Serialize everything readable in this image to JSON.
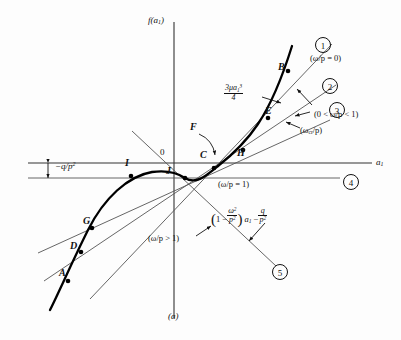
{
  "figure": {
    "caption": "(a)",
    "y_axis_label_f": "f",
    "y_axis_label_arg": "a",
    "y_axis_label_sub": "1",
    "x_axis_label": "a",
    "x_axis_label_sub": "1",
    "origin_label": "0",
    "background_color": "#fdfdfd",
    "ink_color": "#111111",
    "curve_color": "#000000",
    "line_color": "#555555"
  },
  "offset_label": {
    "text": "−q/p",
    "exponent": "2",
    "name": "negative q over p squared"
  },
  "cubic_label": {
    "numerator_a": "3μa",
    "numerator_sub": "1",
    "numerator_sup": "3",
    "denominator": "4"
  },
  "points": [
    {
      "id": "A",
      "x": 61,
      "y": 280
    },
    {
      "id": "B",
      "x": 284,
      "y": 72
    },
    {
      "id": "C",
      "x": 206,
      "y": 156
    },
    {
      "id": "D",
      "x": 76,
      "y": 252
    },
    {
      "id": "E",
      "x": 272,
      "y": 120
    },
    {
      "id": "F",
      "x": 196,
      "y": 133
    },
    {
      "id": "G",
      "x": 89,
      "y": 227
    },
    {
      "id": "H",
      "x": 240,
      "y": 155
    },
    {
      "id": "I",
      "x": 131,
      "y": 169
    },
    {
      "id": "J",
      "x": 170,
      "y": 170
    }
  ],
  "lines": [
    {
      "number": "1",
      "label": "(ω/p = 0)",
      "condition": "omega over p equals zero"
    },
    {
      "number": "2",
      "label": "",
      "condition": "intermediate"
    },
    {
      "number": "3",
      "label": "(0 < ω/p < 1)",
      "secondary": "(ω",
      "secondary_sub": "cr",
      "secondary_rest": "/p)"
    },
    {
      "number": "4",
      "label": "(ω/p = 1)",
      "condition": "omega over p equals one"
    },
    {
      "number": "5",
      "label": "(ω/p > 1)",
      "condition": "omega over p greater than one"
    }
  ],
  "equation": {
    "open": "(",
    "one": "1 −",
    "frac1_num": "ω",
    "frac1_num_sup": "2",
    "frac1_den": "p",
    "frac1_den_sup": "2",
    "close": ")",
    "var": "a",
    "var_sub": "1",
    "minus": "−",
    "frac2_num": "q",
    "frac2_den": "p",
    "frac2_den_sup": "2"
  }
}
